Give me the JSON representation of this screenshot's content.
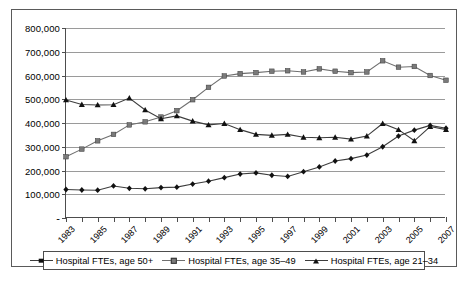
{
  "chart_data": {
    "type": "line",
    "title": "",
    "xlabel": "",
    "ylabel": "",
    "ylim": [
      0,
      800000
    ],
    "ytick_labels": [
      "800,000",
      "700,000",
      "600,000",
      "500,000",
      "400,000",
      "300,000",
      "200,000",
      "100,000",
      "-"
    ],
    "ytick_values": [
      800000,
      700000,
      600000,
      500000,
      400000,
      300000,
      200000,
      100000,
      0
    ],
    "grid": true,
    "legend_position": "bottom",
    "x": [
      1983,
      1984,
      1985,
      1986,
      1987,
      1988,
      1989,
      1990,
      1991,
      1992,
      1993,
      1994,
      1995,
      1996,
      1997,
      1998,
      1999,
      2000,
      2001,
      2002,
      2003,
      2004,
      2005,
      2006,
      2007
    ],
    "xtick_labels": [
      "1983",
      "",
      "1985",
      "",
      "1987",
      "",
      "1989",
      "",
      "1991",
      "",
      "1993",
      "",
      "1995",
      "",
      "1997",
      "",
      "1999",
      "",
      "2001",
      "",
      "2003",
      "",
      "2005",
      "",
      "2007"
    ],
    "series": [
      {
        "name": "Hospital FTEs, age 50+",
        "marker": "diamond",
        "color": "#111111",
        "values": [
          120000,
          118000,
          117000,
          135000,
          125000,
          123000,
          128000,
          130000,
          143000,
          155000,
          170000,
          185000,
          190000,
          180000,
          175000,
          195000,
          215000,
          240000,
          250000,
          265000,
          300000,
          345000,
          370000,
          390000,
          378000
        ]
      },
      {
        "name": "Hospital FTEs, age 35–49",
        "marker": "square",
        "color": "#7a7a7a",
        "values": [
          258000,
          290000,
          325000,
          352000,
          392000,
          405000,
          425000,
          452000,
          498000,
          550000,
          598000,
          608000,
          612000,
          618000,
          620000,
          615000,
          628000,
          618000,
          612000,
          615000,
          662000,
          635000,
          638000,
          600000,
          580000
        ]
      },
      {
        "name": "Hospital FTEs, age 21–34",
        "marker": "triangle",
        "color": "#111111",
        "values": [
          497000,
          478000,
          476000,
          477000,
          505000,
          455000,
          418000,
          430000,
          408000,
          392000,
          398000,
          372000,
          352000,
          348000,
          352000,
          340000,
          338000,
          340000,
          332000,
          345000,
          398000,
          372000,
          325000,
          385000,
          372000
        ]
      }
    ]
  },
  "legend": {
    "entries": [
      {
        "label": "Hospital FTEs, age 50+"
      },
      {
        "label": "Hospital FTEs, age 35–49"
      },
      {
        "label": "Hospital FTEs, age 21–34"
      }
    ]
  }
}
